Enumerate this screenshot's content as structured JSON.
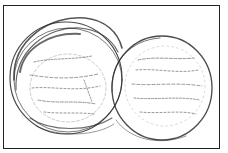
{
  "image": {
    "subject": "Pencil sketch of two overlapping petri dishes with streaked cultures",
    "colors": {
      "ink": "#2a2a2a",
      "background": "#ffffff",
      "frame": "#222222"
    }
  }
}
